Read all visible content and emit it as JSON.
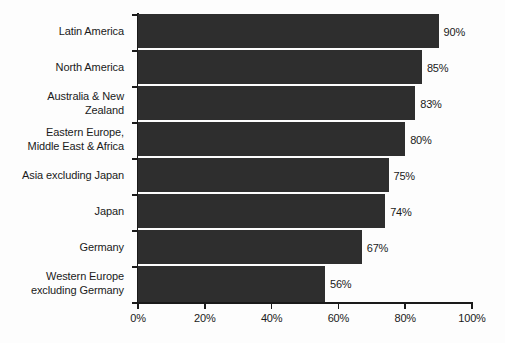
{
  "chart_data": {
    "type": "bar",
    "orientation": "horizontal",
    "title": "",
    "subtitle": "",
    "xlabel": "",
    "ylabel": "",
    "xlim": [
      0,
      100
    ],
    "grid": false,
    "legend": null,
    "xticks": [
      "0%",
      "20%",
      "40%",
      "60%",
      "80%",
      "100%"
    ],
    "xtick_values": [
      0,
      20,
      40,
      60,
      80,
      100
    ],
    "categories": [
      "Latin America",
      "North America",
      "Australia & New Zealand",
      "Eastern Europe, Middle East & Africa",
      "Asia excluding Japan",
      "Japan",
      "Germany",
      "Western Europe excluding Germany"
    ],
    "category_lines": [
      [
        "Latin America"
      ],
      [
        "North America"
      ],
      [
        "Australia & New",
        "Zealand"
      ],
      [
        "Eastern Europe,",
        "Middle East & Africa"
      ],
      [
        "Asia excluding Japan"
      ],
      [
        "Japan"
      ],
      [
        "Germany"
      ],
      [
        "Western Europe",
        "excluding Germany"
      ]
    ],
    "values": [
      90,
      85,
      83,
      80,
      75,
      74,
      67,
      56
    ],
    "value_labels": [
      "90%",
      "85%",
      "83%",
      "80%",
      "75%",
      "74%",
      "67%",
      "56%"
    ],
    "colors": {
      "bar": "#2e2e2e",
      "background": "#fdfdfd",
      "axis": "#1a1a1a",
      "text": "#1a1a1a"
    }
  }
}
